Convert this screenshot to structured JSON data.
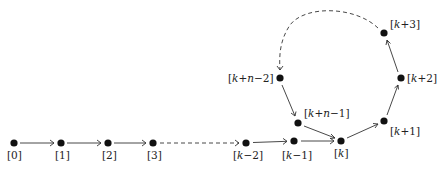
{
  "diagram": {
    "title": "",
    "type": "directed-graph-rho-shape",
    "nodes": [
      {
        "id": "n0",
        "label": "[0]",
        "x": 14,
        "y": 143
      },
      {
        "id": "n1",
        "label": "[1]",
        "x": 61,
        "y": 143
      },
      {
        "id": "n2",
        "label": "[2]",
        "x": 108,
        "y": 143
      },
      {
        "id": "n3",
        "label": "[3]",
        "x": 153,
        "y": 143
      },
      {
        "id": "nkm2",
        "label": "[k−2]",
        "x": 246,
        "y": 143
      },
      {
        "id": "nkm1",
        "label": "[k−1]",
        "x": 294,
        "y": 141
      },
      {
        "id": "nk",
        "label": "[k]",
        "x": 341,
        "y": 141
      },
      {
        "id": "nkp1",
        "label": "[k+1]",
        "x": 384,
        "y": 121
      },
      {
        "id": "nkp2",
        "label": "[k+2]",
        "x": 401,
        "y": 78
      },
      {
        "id": "nkp3",
        "label": "[k+3]",
        "x": 384,
        "y": 33
      },
      {
        "id": "nkn2",
        "label": "[k+n−2]",
        "x": 280,
        "y": 78
      },
      {
        "id": "nkn1",
        "label": "[k+n−1]",
        "x": 298,
        "y": 123
      }
    ],
    "edges": [
      {
        "from": "n0",
        "to": "n1",
        "style": "solid"
      },
      {
        "from": "n1",
        "to": "n2",
        "style": "solid"
      },
      {
        "from": "n2",
        "to": "n3",
        "style": "solid"
      },
      {
        "from": "n3",
        "to": "nkm2",
        "style": "dashed"
      },
      {
        "from": "nkm2",
        "to": "nkm1",
        "style": "solid"
      },
      {
        "from": "nkm1",
        "to": "nk",
        "style": "solid"
      },
      {
        "from": "nk",
        "to": "nkp1",
        "style": "solid"
      },
      {
        "from": "nkp1",
        "to": "nkp2",
        "style": "solid"
      },
      {
        "from": "nkp2",
        "to": "nkp3",
        "style": "solid"
      },
      {
        "from": "nkp3",
        "to": "nkn2",
        "style": "dashed-arc"
      },
      {
        "from": "nkn2",
        "to": "nkn1",
        "style": "solid"
      },
      {
        "from": "nkn1",
        "to": "nk",
        "style": "solid"
      }
    ],
    "labels": {
      "n0": "[0]",
      "n1": "[1]",
      "n2": "[2]",
      "n3": "[3]",
      "nkm2_pre": "[",
      "nkm2_var": "k",
      "nkm2_post": "−2]",
      "nkm1_pre": "[",
      "nkm1_var": "k",
      "nkm1_post": "−1]",
      "nk_pre": "[",
      "nk_var": "k",
      "nk_post": "]",
      "nkp1_pre": "[",
      "nkp1_var": "k",
      "nkp1_post": "+1]",
      "nkp2_pre": "[",
      "nkp2_var": "k",
      "nkp2_post": "+2]",
      "nkp3_pre": "[",
      "nkp3_var": "k",
      "nkp3_post": "+3]",
      "nkn2_pre": "[",
      "nkn2_var1": "k",
      "nkn2_mid": "+",
      "nkn2_var2": "n",
      "nkn2_post": "−2]",
      "nkn1_pre": "[",
      "nkn1_var1": "k",
      "nkn1_mid": "+",
      "nkn1_var2": "n",
      "nkn1_post": "−1]"
    },
    "colors": {
      "node": "#111111",
      "edge": "#333333",
      "text": "#222222",
      "background": "#ffffff"
    }
  }
}
